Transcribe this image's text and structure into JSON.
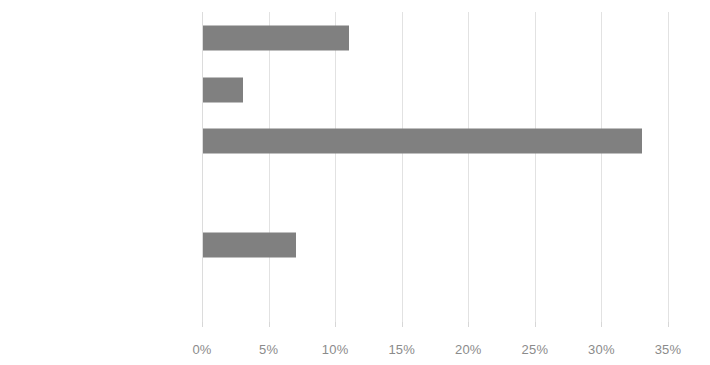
{
  "chart_data": {
    "type": "bar",
    "orientation": "horizontal",
    "title": "",
    "subtitle": "",
    "xlabel": "",
    "ylabel": "",
    "xlim": [
      0,
      35
    ],
    "grid": true,
    "legend": false,
    "legend_position": "none",
    "bar_color": "#808080",
    "gridline_color": "#e2e2e2",
    "text_color": "#6e6e6e",
    "tick_label_color": "#8b8b8b",
    "value_suffix": "%",
    "categories": [
      "Hispanic or Latino",
      "White",
      "Unknown",
      "Multiple Race",
      "Black or African American",
      "Asian"
    ],
    "values": [
      11,
      3,
      33,
      0,
      7,
      0
    ],
    "xticks": [
      0,
      5,
      10,
      15,
      20,
      25,
      30,
      35
    ],
    "xtick_labels": [
      "0%",
      "5%",
      "10%",
      "15%",
      "20%",
      "25%",
      "30%",
      "35%"
    ]
  }
}
